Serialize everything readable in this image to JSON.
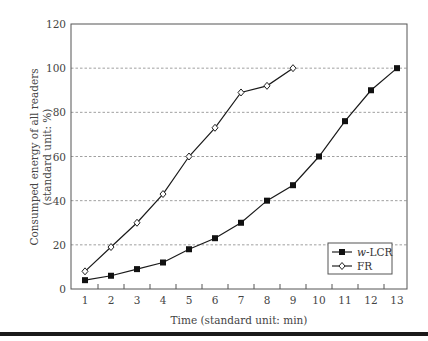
{
  "chart_data": {
    "type": "line",
    "title": "",
    "xlabel": "Time (standard unit: min)",
    "ylabel_line1": "Consumped energy of all readers",
    "ylabel_line2": "(standard unit: %)",
    "xlim": [
      0.5,
      13.5
    ],
    "ylim": [
      0,
      120
    ],
    "x_ticks": [
      1,
      2,
      3,
      4,
      5,
      6,
      7,
      8,
      9,
      10,
      11,
      12,
      13
    ],
    "y_ticks": [
      0,
      20,
      40,
      60,
      80,
      100,
      120
    ],
    "grid": "horizontal dashed",
    "legend_position": "lower right",
    "series": [
      {
        "name": "w-LCR",
        "name_italic_part": "w",
        "name_rest": "-LCR",
        "marker": "filled-square",
        "color": "#1a1a1a",
        "x": [
          1,
          2,
          3,
          4,
          5,
          6,
          7,
          8,
          9,
          10,
          11,
          12,
          13
        ],
        "values": [
          4,
          6,
          9,
          12,
          18,
          23,
          30,
          40,
          47,
          60,
          76,
          90,
          100
        ]
      },
      {
        "name": "FR",
        "marker": "open-diamond",
        "color": "#1a1a1a",
        "x": [
          1,
          2,
          3,
          4,
          5,
          6,
          7,
          8,
          9
        ],
        "values": [
          8,
          19,
          30,
          43,
          60,
          73,
          89,
          92,
          100
        ]
      }
    ]
  }
}
